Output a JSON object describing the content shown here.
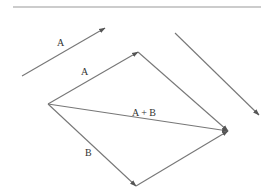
{
  "diagram": {
    "colors": {
      "line": "#777777",
      "text": "#333333",
      "rule": "#bbbbbb",
      "background": "#ffffff"
    },
    "top_rule": {
      "x1": 13,
      "y1": 7,
      "x2": 261,
      "y2": 7
    },
    "free_vectors": [
      {
        "id": "free-A",
        "label": "A",
        "x1": 22,
        "y1": 76,
        "x2": 105,
        "y2": 28,
        "label_x": 57,
        "label_y": 46
      },
      {
        "id": "free-B",
        "label": "",
        "x1": 175,
        "y1": 33,
        "x2": 259,
        "y2": 115,
        "label_x": 0,
        "label_y": 0
      }
    ],
    "origin": {
      "x": 48,
      "y": 104
    },
    "vectors": [
      {
        "id": "vec-A",
        "label": "A",
        "x1": 48,
        "y1": 104,
        "x2": 138,
        "y2": 52,
        "label_x": 81,
        "label_y": 75
      },
      {
        "id": "vec-B",
        "label": "B",
        "x1": 48,
        "y1": 104,
        "x2": 136,
        "y2": 186,
        "label_x": 85,
        "label_y": 156
      },
      {
        "id": "vec-sum",
        "label": "A + B",
        "x1": 48,
        "y1": 104,
        "x2": 228,
        "y2": 131,
        "label_x": 132,
        "label_y": 116
      }
    ],
    "parallelogram_sides": [
      {
        "id": "side-B-from-A",
        "label": "",
        "x1": 138,
        "y1": 52,
        "x2": 228,
        "y2": 131
      },
      {
        "id": "side-A-from-B",
        "label": "",
        "x1": 136,
        "y1": 186,
        "x2": 228,
        "y2": 131
      }
    ]
  }
}
